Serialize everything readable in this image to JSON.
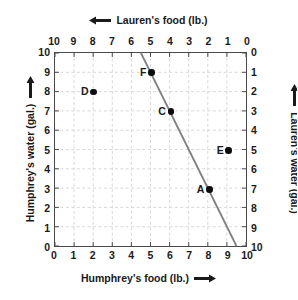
{
  "chart_data": {
    "type": "scatter",
    "title": "",
    "axes": {
      "bottom": {
        "label": "Humphrey's food (lb.)",
        "arrow": "arrow-right-icon",
        "ticks": [
          0,
          1,
          2,
          3,
          4,
          5,
          6,
          7,
          8,
          9,
          10
        ],
        "range": [
          0,
          10
        ],
        "direction": "left-to-right"
      },
      "top": {
        "label": "Lauren's food (lb.)",
        "arrow": "arrow-left-icon",
        "ticks": [
          10,
          9,
          8,
          7,
          6,
          5,
          4,
          3,
          2,
          1,
          0
        ],
        "range": [
          10,
          0
        ],
        "direction": "right-to-left"
      },
      "left": {
        "label": "Humphrey's water (gal.)",
        "arrow": "arrow-up-icon",
        "ticks": [
          10,
          9,
          8,
          7,
          6,
          5,
          4,
          3,
          2,
          1,
          0
        ],
        "range": [
          0,
          10
        ],
        "direction": "bottom-to-top"
      },
      "right": {
        "label": "Lauren's water (gal.)",
        "arrow": "arrow-down-icon",
        "ticks": [
          0,
          1,
          2,
          3,
          4,
          5,
          6,
          7,
          8,
          9,
          10
        ],
        "range": [
          0,
          10
        ],
        "direction": "top-to-bottom"
      }
    },
    "grid": true,
    "grid_style": "dashed",
    "grid_color": "#d8d8d8",
    "legend": "none",
    "points": [
      {
        "label": "A",
        "x": 8,
        "y": 3
      },
      {
        "label": "C",
        "x": 6,
        "y": 7
      },
      {
        "label": "D",
        "x": 2,
        "y": 8
      },
      {
        "label": "E",
        "x": 9,
        "y": 5
      },
      {
        "label": "F",
        "x": 5,
        "y": 9
      }
    ],
    "line": {
      "name": "constraint-line",
      "color": "#808080",
      "slope": -2,
      "intercept": 19,
      "x_start": 4.5,
      "y_start": 10,
      "x_end": 9.5,
      "y_end": 0,
      "passes_through": [
        [
          5,
          9
        ],
        [
          6,
          7
        ],
        [
          8,
          3
        ]
      ]
    },
    "colors": {
      "point": "#0d0d0d",
      "line": "#808080",
      "frame": "#4a4a4a",
      "text": "#1a1a1a",
      "background": "#ffffff"
    }
  }
}
